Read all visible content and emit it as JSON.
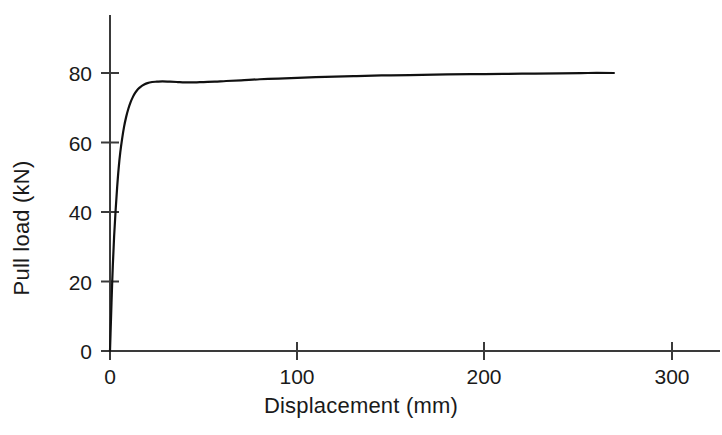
{
  "chart_data": {
    "type": "line",
    "title": "",
    "subtitle": "",
    "xlabel": "Displacement (mm)",
    "ylabel": "Pull load (kN)",
    "xlim": [
      0,
      328
    ],
    "ylim": [
      0,
      97
    ],
    "xticks": [
      0,
      100,
      200,
      300
    ],
    "xticklabels": [
      "0",
      "100",
      "200",
      "300"
    ],
    "yticks": [
      0,
      20,
      40,
      60,
      80
    ],
    "yticklabels": [
      "0",
      "20",
      "40",
      "60",
      "80"
    ],
    "grid": false,
    "legend": false,
    "legend_position": "none",
    "line_color": "#111111",
    "line_width_px": 2.2,
    "axis_color": "#3a3a3a",
    "background": "#ffffff",
    "series": [
      {
        "name": "Pull load vs displacement",
        "x": [
          0,
          0.4,
          0.9,
          1.5,
          2.2,
          3.0,
          3.8,
          4.6,
          5.5,
          6.5,
          7.5,
          8.6,
          9.8,
          11.0,
          12.3,
          13.6,
          15.0,
          16.5,
          18.0,
          20.0,
          22.5,
          25.0,
          28.0,
          32.0,
          36.0,
          40.0,
          45.0,
          50.0,
          56.0,
          62.0,
          70.0,
          80.0,
          90.0,
          100.0,
          115.0,
          130.0,
          145.0,
          160.0,
          180.0,
          200.0,
          220.0,
          240.0,
          255.0,
          269.0
        ],
        "y": [
          0,
          7.0,
          15.5,
          24.5,
          33.0,
          40.5,
          47.0,
          52.5,
          57.2,
          61.2,
          64.5,
          67.3,
          69.7,
          71.6,
          73.2,
          74.4,
          75.4,
          76.1,
          76.6,
          77.1,
          77.4,
          77.5,
          77.6,
          77.5,
          77.4,
          77.3,
          77.3,
          77.4,
          77.5,
          77.7,
          77.9,
          78.2,
          78.4,
          78.6,
          78.9,
          79.1,
          79.3,
          79.4,
          79.6,
          79.7,
          79.8,
          79.9,
          80.0,
          80.0
        ]
      }
    ],
    "annotations": []
  },
  "axes": {
    "y_axis_top_value": 97,
    "x_axis_right_value": 328,
    "tick_direction": "crossing",
    "spines": [
      "left",
      "bottom"
    ]
  }
}
